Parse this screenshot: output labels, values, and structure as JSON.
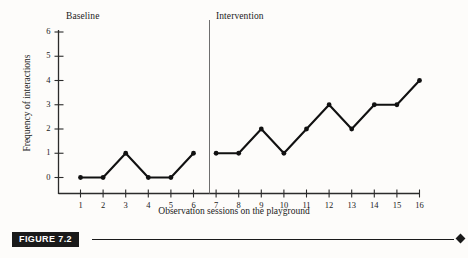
{
  "figure": {
    "caption_tag": "FIGURE 7.2",
    "phase_labels": {
      "baseline": "Baseline",
      "intervention": "Intervention"
    }
  },
  "chart_data": {
    "type": "line",
    "title": "",
    "xlabel": "Observation sessions on the playground",
    "ylabel": "Frequency of interactions",
    "x": [
      1,
      2,
      3,
      4,
      5,
      6,
      7,
      8,
      9,
      10,
      11,
      12,
      13,
      14,
      15,
      16
    ],
    "xticklabels": [
      "1",
      "2",
      "3",
      "4",
      "5",
      "6",
      "7",
      "8",
      "9",
      "10",
      "11",
      "12",
      "13",
      "14",
      "15",
      "16"
    ],
    "yticklabels": [
      "0",
      "1",
      "2",
      "3",
      "4",
      "5",
      "6"
    ],
    "yticks": [
      0,
      1,
      2,
      3,
      4,
      5,
      6
    ],
    "xlim": [
      0.3,
      16.7
    ],
    "ylim": [
      0,
      6
    ],
    "grid": false,
    "legend": false,
    "marker": "filled-circle",
    "line_color": "#111111",
    "series": [
      {
        "name": "Baseline",
        "x": [
          1,
          2,
          3,
          4,
          5,
          6
        ],
        "values": [
          0,
          0,
          1,
          0,
          0,
          1
        ]
      },
      {
        "name": "Intervention",
        "x": [
          7,
          8,
          9,
          10,
          11,
          12,
          13,
          14,
          15,
          16
        ],
        "values": [
          1,
          1,
          2,
          1,
          2,
          3,
          2,
          3,
          3,
          4
        ]
      }
    ],
    "annotations": [
      {
        "name": "phase-divider",
        "type": "vline",
        "x": 6.5,
        "label": ""
      },
      {
        "name": "baseline-phase-label",
        "type": "text",
        "text": "Baseline",
        "x": 1.3,
        "y": 6.6
      },
      {
        "name": "intervention-phase-label",
        "type": "text",
        "text": "Intervention",
        "x": 7.0,
        "y": 6.6
      }
    ]
  }
}
